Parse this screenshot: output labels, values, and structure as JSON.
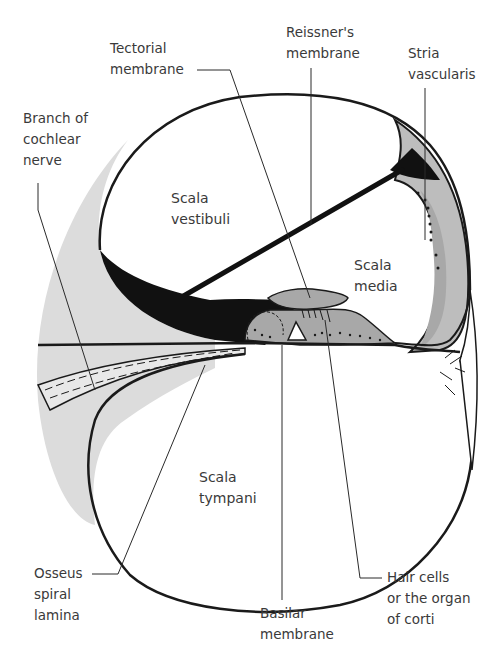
{
  "diagram": {
    "colors": {
      "outline": "#1a1a1a",
      "bone_light_gray": "#dcdcdc",
      "tissue_mid_gray": "#a8a8a8",
      "stria_gray": "#bdbdbd",
      "dark_fill": "#111111",
      "label_text": "#3a3a3a",
      "background": "#ffffff"
    },
    "regions": {
      "scala_vestibuli": "Scala\nvestibuli",
      "scala_media": "Scala\nmedia",
      "scala_tympani": "Scala\ntympani"
    },
    "labels": {
      "tectorial_membrane": "Tectorial\nmembrane",
      "reissners_membrane": "Reissner's\nmembrane",
      "stria_vascularis": "Stria\nvascularis",
      "branch_of_cochlear_nerve": "Branch of\ncochlear\nnerve",
      "osseus_spiral_lamina": "Osseus\nspiral\nlamina",
      "basilar_membrane": "Basilar\nmembrane",
      "hair_cells": "Hair cells\nor the organ\nof corti"
    }
  }
}
